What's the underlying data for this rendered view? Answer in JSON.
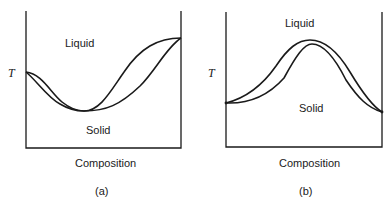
{
  "diagrams": [
    {
      "id": "a",
      "caption": "(a)",
      "y_axis_label": "T",
      "x_axis_label": "Composition",
      "region_labels": {
        "upper": "Liquid",
        "lower": "Solid"
      },
      "description": "Phase diagram with a minimum: liquidus and solidus meet at both ends and touch at a minimum melting point"
    },
    {
      "id": "b",
      "caption": "(b)",
      "y_axis_label": "T",
      "x_axis_label": "Composition",
      "region_labels": {
        "upper": "Liquid",
        "lower": "Solid"
      },
      "description": "Phase diagram with a maximum: liquidus and solidus meet at both ends and touch at a maximum melting point"
    }
  ],
  "colors": {
    "line": "#1a1a1a",
    "background": "#ffffff"
  }
}
